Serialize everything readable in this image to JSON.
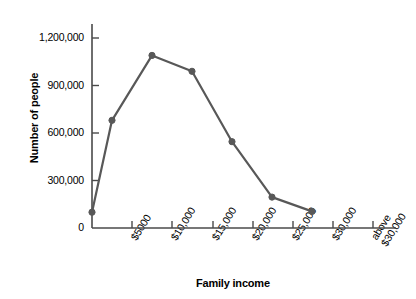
{
  "chart_data": {
    "type": "line",
    "title": "",
    "xlabel": "Family income",
    "ylabel": "Number of people",
    "categories": [
      "$5000",
      "$10,000",
      "$15,000",
      "$20,000",
      "$25,000",
      "$30,000",
      "above $30,000"
    ],
    "category_lines": [
      [
        "$5000"
      ],
      [
        "$10,000"
      ],
      [
        "$15,000"
      ],
      [
        "$20,000"
      ],
      [
        "$25,000"
      ],
      [
        "$30,000"
      ],
      [
        "above",
        "$30,000"
      ]
    ],
    "x_positions": [
      132,
      172,
      213,
      253,
      293,
      333,
      373
    ],
    "series": [
      {
        "name": "Number of people",
        "points": [
          {
            "x": 92,
            "value": 100000
          },
          {
            "x": 112,
            "value": 680000
          },
          {
            "x": 152,
            "value": 1090000
          },
          {
            "x": 192,
            "value": 990000
          },
          {
            "x": 232,
            "value": 545000
          },
          {
            "x": 272,
            "value": 195000
          },
          {
            "x": 312,
            "value": 105000
          }
        ]
      }
    ],
    "yticks": [
      0,
      300000,
      600000,
      900000,
      1200000
    ],
    "ytick_labels": [
      "0",
      "300,000",
      "600,000",
      "900,000",
      "1,200,000"
    ],
    "ylim": [
      0,
      1320000
    ],
    "grid": false,
    "legend": "none",
    "line_color": "#585858",
    "marker_color": "#585858",
    "axis_color": "#4a4a4a"
  }
}
